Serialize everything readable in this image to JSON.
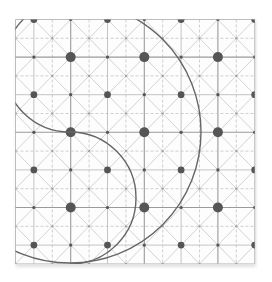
{
  "figure": {
    "grid": {
      "x0": 15.5,
      "y0": 19.5,
      "cell_w": 18.4,
      "cell_h": 18.8,
      "cols": 13,
      "rows": 13
    },
    "colors": {
      "major_line": "#9a9a9a",
      "minor_solid_line": "#bdbdbd",
      "dashed_line": "#c4c4c4",
      "diagonal_line": "#c8c8c8",
      "dot": "#555555",
      "arc": "#666666",
      "border": "#bdbdbd"
    },
    "major_every": 4,
    "dots": {
      "large_radius": 5,
      "medium_radius": 3.4,
      "small_radius": 1.6,
      "tiny_radius": 1.1
    },
    "arcs": [
      {
        "name": "big-circle",
        "cx": 70,
        "cy": 132,
        "r": 131
      },
      {
        "name": "upper-left-half-circle",
        "cx": 70,
        "cy": 66,
        "r": 66,
        "half": "left"
      },
      {
        "name": "lower-right-half-circle",
        "cx": 70,
        "cy": 198,
        "r": 66,
        "half": "right"
      }
    ]
  }
}
